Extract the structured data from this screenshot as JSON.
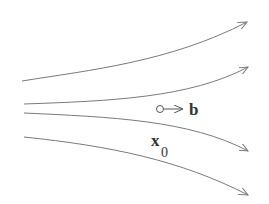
{
  "diagram": {
    "type": "flow-lines",
    "stroke_color": "#7a7a7a",
    "text_color": "#333333",
    "background": "#ffffff",
    "curves": [
      {
        "id": "curve-1",
        "path": "M22,81 C90,70 170,62 247,22",
        "direction": "up-right"
      },
      {
        "id": "curve-2",
        "path": "M24,104 C110,101 190,98 248,67",
        "direction": "up-right"
      },
      {
        "id": "curve-3",
        "path": "M24,113 C110,117 190,120 248,151",
        "direction": "down-right"
      },
      {
        "id": "curve-4",
        "path": "M24,137 C110,146 180,160 248,195",
        "direction": "down-right"
      }
    ],
    "vector_b": {
      "origin_circle": {
        "cx": 160,
        "cy": 109,
        "r": 3.5
      },
      "arrow_to": {
        "x": 183,
        "y": 109
      },
      "label": "b"
    },
    "point_x0": {
      "label_main": "x",
      "label_sub": "0"
    }
  }
}
